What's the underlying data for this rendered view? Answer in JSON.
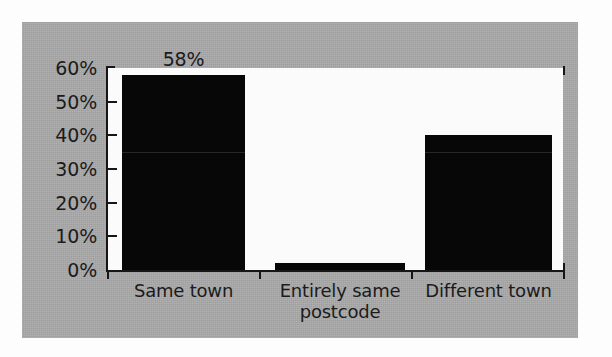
{
  "chart_data": {
    "type": "bar",
    "title": "",
    "subtitle": "",
    "xlabel": "",
    "ylabel": "",
    "categories": [
      "Same town",
      "Entirely same\npostcode",
      "Different town"
    ],
    "values": [
      58,
      40,
      40
    ],
    "series": [
      {
        "name": "Share of respondents",
        "values": [
          58,
          2,
          40
        ]
      }
    ],
    "data_labels": [
      "58%",
      "2%",
      "40%"
    ],
    "ylim": [
      0,
      60
    ],
    "ytick_values": [
      0,
      10,
      20,
      30,
      40,
      50,
      60
    ],
    "ytick_labels": [
      "0%",
      "10%",
      "20%",
      "30%",
      "40%",
      "50%",
      "60%"
    ],
    "grid": false,
    "legend": false,
    "legend_position": "none",
    "bar_color": "#070707",
    "plot_background": "#fbfbfb",
    "figure_background": "#a9a9a9",
    "axis_color": "#161616",
    "text_color": "#1b1b1b"
  },
  "bars": [
    {
      "label": "Same town",
      "value": 58,
      "data_label": "58%"
    },
    {
      "label": "Entirely same\npostcode",
      "value": 2,
      "data_label": "2%"
    },
    {
      "label": "Different town",
      "value": 40,
      "data_label": "40%"
    }
  ],
  "yaxis": {
    "ticks": [
      {
        "label": "60%",
        "value": 60
      },
      {
        "label": "50%",
        "value": 50
      },
      {
        "label": "40%",
        "value": 40
      },
      {
        "label": "30%",
        "value": 30
      },
      {
        "label": "20%",
        "value": 20
      },
      {
        "label": "10%",
        "value": 10
      },
      {
        "label": "0%",
        "value": 0
      }
    ]
  }
}
